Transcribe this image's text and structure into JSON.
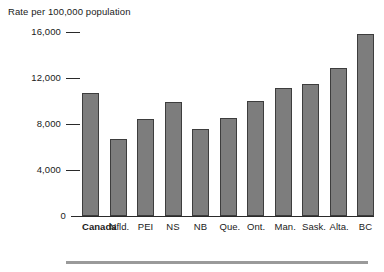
{
  "chart_data": {
    "type": "bar",
    "title": "",
    "axis_note": "Rate per 100,000 population",
    "xlabel": "",
    "ylabel": "Rate per 100,000 population",
    "ylim": [
      0,
      16000
    ],
    "grid": false,
    "legend": null,
    "ytick_labels": [
      "16,000",
      "12,000",
      "8,000",
      "4,000",
      "0"
    ],
    "ytick_values": [
      16000,
      12000,
      8000,
      4000,
      0
    ],
    "categories": [
      "Canada",
      "Nfld.",
      "PEI",
      "NS",
      "NB",
      "Que.",
      "Ont.",
      "Man.",
      "Sask.",
      "Alta.",
      "BC"
    ],
    "values": [
      10700,
      6700,
      8400,
      9900,
      7600,
      8500,
      10000,
      11100,
      11500,
      12900,
      15800
    ],
    "emphasized_category": "Canada",
    "bar_color": "#7d7d7d",
    "bar_border_color": "#3d3d3d",
    "axis_color": "#2a2a2a",
    "rule_color": "#9a9a9a"
  }
}
